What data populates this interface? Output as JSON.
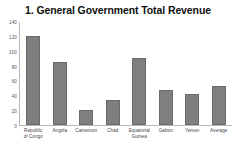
{
  "chart_data": {
    "type": "bar",
    "title": "1. General Government Total Revenue",
    "xlabel": "",
    "ylabel": "",
    "ylim": [
      0,
      140
    ],
    "yticks": [
      0,
      20,
      40,
      60,
      80,
      100,
      120,
      140
    ],
    "grid": false,
    "legend": null,
    "bar_color": "#7f7f7f",
    "categories": [
      "Republic of Congo",
      "Angola",
      "Cameroon",
      "Chad",
      "Equatorial Guinea",
      "Gabon",
      "Yemen",
      "Average"
    ],
    "category_lines": [
      [
        "Republic",
        "of Congo"
      ],
      [
        "Angola"
      ],
      [
        "Cameroon"
      ],
      [
        "Chad"
      ],
      [
        "Equatorial",
        "Guinea"
      ],
      [
        "Gabon"
      ],
      [
        "Yemen"
      ],
      [
        "Average"
      ]
    ],
    "values": [
      121,
      85,
      21,
      34,
      91,
      47,
      42,
      53
    ]
  }
}
